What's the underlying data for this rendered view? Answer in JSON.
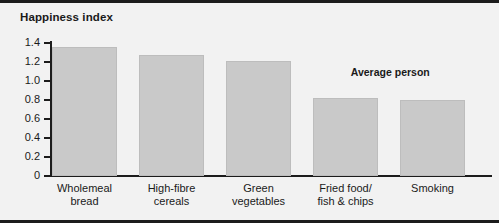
{
  "chart_data": {
    "type": "bar",
    "title": "Happiness index",
    "xlabel": "",
    "ylabel": "Happiness index",
    "categories": [
      "Wholemeal bread",
      "High-fibre cereals",
      "Green vegetables",
      "Fried food/ fish & chips",
      "Smoking"
    ],
    "category_lines": [
      [
        "Wholemeal",
        "bread"
      ],
      [
        "High-fibre",
        "cereals"
      ],
      [
        "Green",
        "vegetables"
      ],
      [
        "Fried food/",
        "fish & chips"
      ],
      [
        "Smoking"
      ]
    ],
    "values": [
      1.36,
      1.27,
      1.21,
      0.82,
      0.8
    ],
    "ylim": [
      0,
      1.4
    ],
    "ytick_labels": [
      "0",
      "0.2",
      "0.4",
      "0.6",
      "0.8",
      "1.0",
      "1.2",
      "1.4"
    ],
    "ytick_values": [
      0,
      0.2,
      0.4,
      0.6,
      0.8,
      1.0,
      1.2,
      1.4
    ],
    "grid": false,
    "legend": "none",
    "annotations": [
      {
        "text": "Average person",
        "x_frac": 0.78,
        "y_value": 1.1
      }
    ],
    "colors": {
      "bar_fill": "#c9c9c9",
      "bar_edge": "#bdbdbd",
      "axis": "#1c1c1c",
      "background": "#f2f2f2",
      "text": "#1a1a1a"
    }
  }
}
